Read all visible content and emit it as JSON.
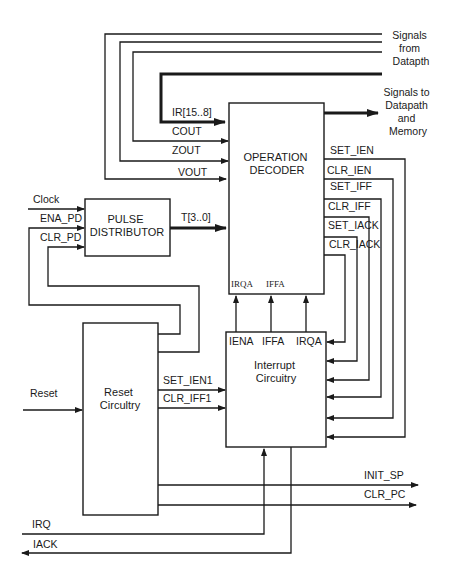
{
  "diagram": {
    "external": {
      "signals_from_datapath": [
        "Signals",
        "from",
        "Datapth"
      ],
      "signals_to_datapath": [
        "Signals to",
        "Datapath",
        "and",
        "Memory"
      ],
      "clock": "Clock",
      "reset": "Reset",
      "irq": "IRQ",
      "iack": "IACK",
      "init_sp": "INIT_SP",
      "clr_pc": "CLR_PC"
    },
    "blocks": {
      "operation_decoder": [
        "OPERATION",
        "DECODER"
      ],
      "pulse_distributor": [
        "PULSE",
        "DISTRIBUTOR"
      ],
      "reset_circuitry": [
        "Reset",
        "Circultry"
      ],
      "interrupt_circuitry": [
        "Interrupt",
        "Circuitry"
      ]
    },
    "decoder_inputs": {
      "ir": "IR[15..8]",
      "cout": "COUT",
      "zout": "ZOUT",
      "vout": "VOUT",
      "t": "T[3..0]"
    },
    "decoder_bottom_ports": [
      "IRQA",
      "IFFA"
    ],
    "decoder_outputs": [
      "SET_IEN",
      "CLR_IEN",
      "SET_IFF",
      "CLR_IFF",
      "SET_IACK",
      "CLR_IACK"
    ],
    "pulse_inputs": [
      "ENA_PD",
      "CLR_PD"
    ],
    "reset_outputs": [
      "SET_IEN1",
      "CLR_IFF1"
    ],
    "interrupt_top_ports": [
      "IENA",
      "IFFA",
      "IRQA"
    ]
  }
}
